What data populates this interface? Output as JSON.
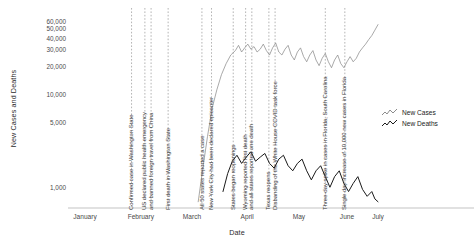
{
  "chart_data": {
    "type": "line",
    "title": "",
    "xlabel": "Date",
    "ylabel": "New Cases and Deaths",
    "yscale": "log",
    "ylim": [
      600,
      75000
    ],
    "grid": false,
    "legend_position": "right",
    "yticks": [
      {
        "value": 60000,
        "label": "60,000"
      },
      {
        "value": 50000,
        "label": "50,000"
      },
      {
        "value": 40000,
        "label": "40,000"
      },
      {
        "value": 30000,
        "label": "30,000"
      },
      {
        "value": 20000,
        "label": "20,000"
      },
      {
        "value": 10000,
        "label": "10,000"
      },
      {
        "value": 5000,
        "label": "5,000"
      },
      {
        "value": 1000,
        "label": "1,000"
      }
    ],
    "xticks": [
      {
        "pos": 0.055,
        "label": "January"
      },
      {
        "pos": 0.235,
        "label": "February"
      },
      {
        "pos": 0.4,
        "label": "March"
      },
      {
        "pos": 0.578,
        "label": "April"
      },
      {
        "pos": 0.745,
        "label": "May"
      },
      {
        "pos": 0.9,
        "label": "June"
      },
      {
        "pos": 1.0,
        "label": "July"
      }
    ],
    "series": [
      {
        "name": "New Cases",
        "color": "#8c8c8c",
        "values": [
          [
            0.0,
            0
          ],
          [
            0.12,
            0
          ],
          [
            0.18,
            1
          ],
          [
            0.25,
            2
          ],
          [
            0.3,
            5
          ],
          [
            0.34,
            12
          ],
          [
            0.37,
            40
          ],
          [
            0.39,
            120
          ],
          [
            0.405,
            300
          ],
          [
            0.42,
            700
          ],
          [
            0.435,
            1600
          ],
          [
            0.45,
            3500
          ],
          [
            0.465,
            7000
          ],
          [
            0.48,
            11000
          ],
          [
            0.495,
            16000
          ],
          [
            0.51,
            21000
          ],
          [
            0.525,
            26000
          ],
          [
            0.54,
            29000
          ],
          [
            0.55,
            33000
          ],
          [
            0.56,
            28000
          ],
          [
            0.57,
            31000
          ],
          [
            0.58,
            34000
          ],
          [
            0.59,
            30000
          ],
          [
            0.6,
            32000
          ],
          [
            0.61,
            28000
          ],
          [
            0.62,
            30000
          ],
          [
            0.63,
            34000
          ],
          [
            0.64,
            29000
          ],
          [
            0.65,
            26000
          ],
          [
            0.66,
            31000
          ],
          [
            0.67,
            35000
          ],
          [
            0.68,
            28000
          ],
          [
            0.69,
            26000
          ],
          [
            0.7,
            30000
          ],
          [
            0.71,
            33000
          ],
          [
            0.72,
            26000
          ],
          [
            0.73,
            23000
          ],
          [
            0.74,
            28000
          ],
          [
            0.75,
            31000
          ],
          [
            0.76,
            25000
          ],
          [
            0.77,
            22000
          ],
          [
            0.78,
            26000
          ],
          [
            0.79,
            29000
          ],
          [
            0.8,
            23000
          ],
          [
            0.81,
            20000
          ],
          [
            0.82,
            24000
          ],
          [
            0.83,
            27000
          ],
          [
            0.84,
            22000
          ],
          [
            0.85,
            19000
          ],
          [
            0.86,
            23000
          ],
          [
            0.87,
            26000
          ],
          [
            0.88,
            21000
          ],
          [
            0.89,
            19000
          ],
          [
            0.9,
            22000
          ],
          [
            0.91,
            25000
          ],
          [
            0.92,
            22000
          ],
          [
            0.93,
            24000
          ],
          [
            0.94,
            28000
          ],
          [
            0.95,
            31000
          ],
          [
            0.96,
            34000
          ],
          [
            0.97,
            38000
          ],
          [
            0.98,
            42000
          ],
          [
            0.99,
            48000
          ],
          [
            1.0,
            55000
          ]
        ]
      },
      {
        "name": "New Deaths",
        "color": "#1a1a1a",
        "values": [
          [
            0.0,
            0
          ],
          [
            0.2,
            0
          ],
          [
            0.3,
            1
          ],
          [
            0.36,
            2
          ],
          [
            0.4,
            5
          ],
          [
            0.42,
            14
          ],
          [
            0.44,
            40
          ],
          [
            0.455,
            100
          ],
          [
            0.47,
            250
          ],
          [
            0.485,
            500
          ],
          [
            0.5,
            900
          ],
          [
            0.515,
            1400
          ],
          [
            0.53,
            1900
          ],
          [
            0.545,
            2200
          ],
          [
            0.56,
            1800
          ],
          [
            0.575,
            2100
          ],
          [
            0.59,
            2400
          ],
          [
            0.605,
            1900
          ],
          [
            0.62,
            2100
          ],
          [
            0.635,
            2300
          ],
          [
            0.65,
            1800
          ],
          [
            0.665,
            1600
          ],
          [
            0.68,
            2000
          ],
          [
            0.695,
            2200
          ],
          [
            0.71,
            1700
          ],
          [
            0.725,
            1500
          ],
          [
            0.74,
            1800
          ],
          [
            0.755,
            2000
          ],
          [
            0.77,
            1500
          ],
          [
            0.785,
            1200
          ],
          [
            0.8,
            1500
          ],
          [
            0.815,
            1700
          ],
          [
            0.83,
            1300
          ],
          [
            0.845,
            1000
          ],
          [
            0.86,
            1300
          ],
          [
            0.875,
            1500
          ],
          [
            0.89,
            1100
          ],
          [
            0.905,
            900
          ],
          [
            0.92,
            1100
          ],
          [
            0.935,
            1300
          ],
          [
            0.95,
            950
          ],
          [
            0.965,
            800
          ],
          [
            0.98,
            900
          ],
          [
            0.99,
            750
          ],
          [
            1.0,
            700
          ]
        ]
      }
    ],
    "annotations": [
      {
        "pos": 0.205,
        "label": "Confirmed case in Washington State"
      },
      {
        "pos": 0.248,
        "label": "US declared public health emergency"
      },
      {
        "pos": 0.268,
        "label": "and banned foreign travel from China"
      },
      {
        "pos": 0.323,
        "label": "First death in Washington State"
      },
      {
        "pos": 0.432,
        "label": "All 50 states reported a case"
      },
      {
        "pos": 0.463,
        "label": "New York City had been declared epicenter"
      },
      {
        "pos": 0.533,
        "label": "States began reopenings"
      },
      {
        "pos": 0.573,
        "label": "Wyoming reported first death"
      },
      {
        "pos": 0.593,
        "label": "and all states reported one death"
      },
      {
        "pos": 0.648,
        "label": "Texas reopens"
      },
      {
        "pos": 0.668,
        "label": "Disbanding of the White House COVID task force"
      },
      {
        "pos": 0.83,
        "label": "Three-day spike in cases in Florida, South Carolina"
      },
      {
        "pos": 0.893,
        "label": "Single day increase of 10,000 new cases in Florida"
      }
    ]
  }
}
